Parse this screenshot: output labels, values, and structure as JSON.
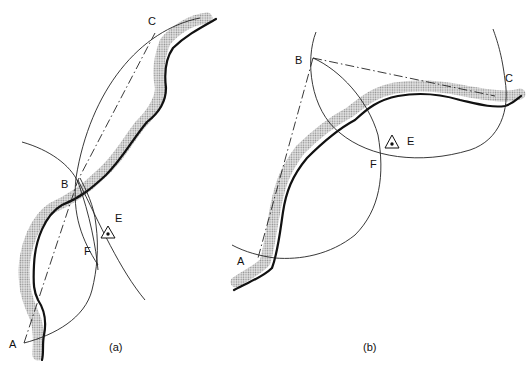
{
  "figure": {
    "panels": [
      {
        "id": "a",
        "caption": "(a)",
        "points": {
          "A": "A",
          "B": "B",
          "C": "C",
          "E": "E",
          "F": "F"
        }
      },
      {
        "id": "b",
        "caption": "(b)",
        "points": {
          "A": "A",
          "B": "B",
          "C": "C",
          "E": "E",
          "F": "F"
        }
      }
    ],
    "colors": {
      "line": "#222222",
      "bank": "#111111",
      "river_stipple": "#9a9a9a",
      "background": "#ffffff"
    }
  }
}
